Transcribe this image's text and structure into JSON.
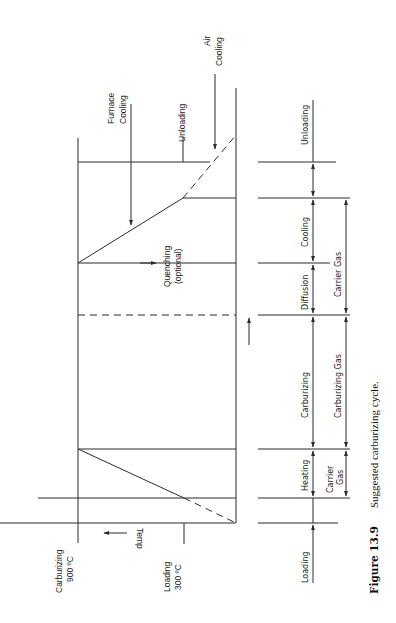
{
  "figure": {
    "number": "Figure 13.9",
    "caption": "Suggested carburizing cycle."
  },
  "temperature_axis": {
    "label": "Temp",
    "levels": [
      {
        "name": "Carburizing",
        "value": "900 ºC"
      },
      {
        "name": "Loading",
        "value": "300 ºC"
      }
    ]
  },
  "profile_annotations": {
    "furnace_cooling": [
      "Furnace",
      "Cooling"
    ],
    "air_cooling": [
      "Air",
      "Cooling"
    ],
    "unloading": "Unloading",
    "quenching": [
      "Quenching",
      "(optional)"
    ]
  },
  "stages": [
    {
      "label": "Loading"
    },
    {
      "label": "Heating"
    },
    {
      "label": "Carburizing"
    },
    {
      "label": "Diffusion"
    },
    {
      "label": "Cooling"
    },
    {
      "label": "Unloading"
    }
  ],
  "atmospheres": [
    {
      "label": [
        "Carrier",
        "Gas"
      ],
      "span": "Heating"
    },
    {
      "label": [
        "Carburizing Gas"
      ],
      "span": "Carburizing"
    },
    {
      "label": [
        "Carrier Gas"
      ],
      "span": "Diffusion + Cooling"
    }
  ],
  "colors": {
    "line": "#2b2b2b",
    "text": "#222222",
    "background": "#ffffff"
  }
}
